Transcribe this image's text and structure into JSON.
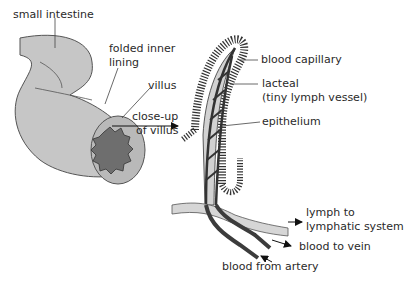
{
  "diagram": {
    "labels": {
      "small_intestine": "small intestine",
      "folded_inner_lining_1": "folded inner",
      "folded_inner_lining_2": "lining",
      "villus": "villus",
      "close_up_1": "close-up",
      "close_up_2": "of villus",
      "blood_capillary": "blood capillary",
      "lacteal_1": "lacteal",
      "lacteal_2": "(tiny lymph vessel)",
      "epithelium": "epithelium",
      "lymph_1": "lymph to",
      "lymph_2": "lymphatic system",
      "blood_to_vein": "blood to vein",
      "blood_from_artery": "blood from artery"
    },
    "colors": {
      "intestine_fill": "#c4c4c4",
      "lining_fill": "#6e6e6e",
      "epithelium": "#3a3a3a",
      "lymph_vessel": "#d6d6d6",
      "blood_vessel": "#3c3c3c",
      "text": "#2a2a2a"
    }
  }
}
